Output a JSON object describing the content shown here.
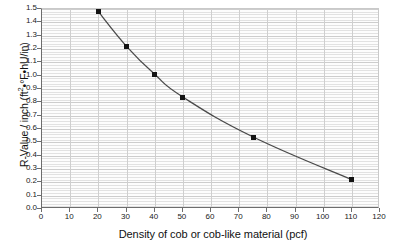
{
  "chart_data": {
    "type": "line",
    "title": "",
    "xlabel": "Density of cob or cob-like material (pcf)",
    "ylabel": "R-Value / inch (ft²•°F•hU/in)",
    "ylabel_parts": {
      "prefix": "R-Value / inch (ft",
      "sup": "2",
      "suffix": "•°F•hU/in)"
    },
    "x": [
      20,
      30,
      40,
      50,
      75,
      110
    ],
    "values": [
      1.48,
      1.22,
      1.01,
      0.84,
      0.54,
      0.22
    ],
    "series": [
      {
        "name": "R-Value per inch vs density",
        "x": [
          20,
          30,
          40,
          50,
          75,
          110
        ],
        "values": [
          1.48,
          1.22,
          1.01,
          0.84,
          0.54,
          0.22
        ]
      }
    ],
    "xlim": [
      0,
      120
    ],
    "ylim": [
      0.0,
      1.5
    ],
    "xticks": [
      0,
      10,
      20,
      30,
      40,
      50,
      60,
      70,
      80,
      90,
      100,
      110,
      120
    ],
    "xtick_labels": [
      "0",
      "10",
      "20",
      "30",
      "40",
      "50",
      "60",
      "70",
      "80",
      "90",
      "100",
      "110",
      "120"
    ],
    "yticks": [
      0.0,
      0.1,
      0.2,
      0.3,
      0.4,
      0.5,
      0.6,
      0.7,
      0.8,
      0.9,
      1.0,
      1.1,
      1.2,
      1.3,
      1.4,
      1.5
    ],
    "ytick_labels": [
      "0.0",
      "0.1",
      "0.2",
      "0.3",
      "0.4",
      "0.5",
      "0.6",
      "0.7",
      "0.8",
      "0.9",
      "1.0",
      "1.1",
      "1.2",
      "1.3",
      "1.4",
      "1.5"
    ],
    "grid": {
      "horizontal_major": true,
      "horizontal_minor": true,
      "vertical_major": true,
      "vertical_minor": false,
      "minor_y_step": 0.02
    },
    "legend": {
      "visible": false,
      "position": "none",
      "entries": []
    },
    "annotations": [],
    "colors": {
      "line": "#4a4a4a",
      "marker": "#141414",
      "axis": "#6d6d6d",
      "grid_major": "#cdcdcd",
      "grid_minor": "#e2e2e2",
      "plot_background": "#fdfdfd",
      "page_background": "#ffffff",
      "text": "#111111"
    }
  }
}
